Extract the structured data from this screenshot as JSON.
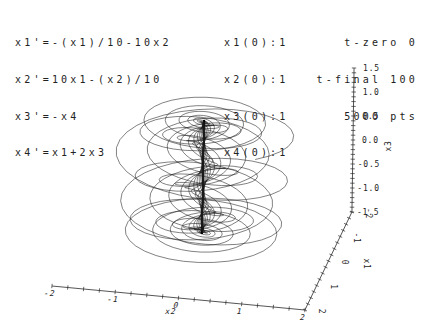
{
  "header": {
    "equations": [
      "x1'=-(x1)/10-10x2",
      "x2'=10x1-(x2)/10",
      "x3'=-x4",
      "x4'=x1+2x3"
    ],
    "initial_conditions": [
      "x1(0):1",
      "x2(0):1",
      "x3(0):1",
      "x4(0):1"
    ],
    "time_params": [
      "t-zero 0",
      "t-final 100",
      "5000 pts"
    ]
  },
  "colors": {
    "background": "#ffffff",
    "text": "#222222",
    "axis": "#2a2a2a",
    "trajectory": "#1a1a1a"
  },
  "chart_data": {
    "type": "line",
    "title": "",
    "ode": {
      "variables": [
        "x1",
        "x2",
        "x3",
        "x4"
      ],
      "equations": [
        "x1'=-(x1)/10-10x2",
        "x2'=10x1-(x2)/10",
        "x3'=-x4",
        "x4'=x1+2x3"
      ],
      "matrix": [
        [
          -0.1,
          -10.0,
          0.0,
          0.0
        ],
        [
          10.0,
          -0.1,
          0.0,
          0.0
        ],
        [
          0.0,
          0.0,
          0.0,
          -1.0
        ],
        [
          1.0,
          0.0,
          2.0,
          0.0
        ]
      ],
      "x0": [
        1,
        1,
        1,
        1
      ],
      "t_zero": 0,
      "t_final": 100,
      "n_points": 5000
    },
    "axes": {
      "x1": {
        "title": "x1",
        "min": -2,
        "max": 2,
        "tick_step": 0.25,
        "labels": [
          {
            "v": 2,
            "t": "2"
          },
          {
            "v": 1,
            "t": "1"
          },
          {
            "v": 0,
            "t": "0"
          },
          {
            "v": -1,
            "t": "-1"
          },
          {
            "v": -2,
            "t": "-2"
          }
        ]
      },
      "x2": {
        "title": "x2",
        "min": -2,
        "max": 2,
        "tick_step": 0.25,
        "labels": [
          {
            "v": -2,
            "t": "-2"
          },
          {
            "v": -1,
            "t": "-1"
          },
          {
            "v": 0,
            "t": "0"
          },
          {
            "v": 1,
            "t": "1"
          },
          {
            "v": 2,
            "t": "2"
          }
        ]
      },
      "x3": {
        "title": "x3",
        "min": -1.5,
        "max": 1.5,
        "tick_step": 0.1,
        "labels": [
          {
            "v": 1.5,
            "t": "1.5"
          },
          {
            "v": 1.0,
            "t": "1.0"
          },
          {
            "v": 0.5,
            "t": "0.5"
          },
          {
            "v": 0.0,
            "t": "0.0"
          },
          {
            "v": -0.5,
            "t": "-0.5"
          },
          {
            "v": -1.0,
            "t": "-1.0"
          },
          {
            "v": -1.5,
            "t": "-1.5"
          }
        ]
      }
    },
    "grid": false,
    "legend": false,
    "projection": {
      "origin": [
        203.0,
        177.0
      ],
      "e_x1": [
        -11.75,
        24.5
      ],
      "e_x2": [
        63.25,
        6.0
      ],
      "e_x3": [
        0.7,
        -48.0
      ]
    },
    "axis_style": {
      "color": "#2a2a2a",
      "line_width": 0.8,
      "tick_width": 0.7,
      "tick_half_len": 2.2
    },
    "stroke": {
      "color": "#1a1a1a",
      "width": 0.55
    },
    "layout": {
      "segments": [
        {
          "name": "x2-axis",
          "from": [
            2,
            -2,
            -1.5
          ],
          "to": [
            2,
            2,
            -1.5
          ],
          "vary": "x2"
        },
        {
          "name": "x1-axis",
          "from": [
            2,
            2,
            -1.5
          ],
          "to": [
            -2,
            2,
            -1.5
          ],
          "vary": "x1"
        },
        {
          "name": "x3-axis",
          "from": [
            -2,
            2,
            -1.5
          ],
          "to": [
            -2,
            2,
            1.5
          ],
          "vary": "x3"
        }
      ],
      "tick_label_style": {
        "x2": {
          "dx": -3,
          "dy": 10,
          "rotate": 0,
          "skew": -14,
          "anchor": "middle"
        },
        "x1": {
          "dx": 14,
          "dy": 1.5,
          "rotate": 90,
          "skew": 0,
          "anchor": "middle"
        },
        "x3": {
          "dx": 9,
          "dy": 2.5,
          "rotate": 0,
          "skew": 0,
          "anchor": "start",
          "neg_dx": 5
        }
      },
      "axis_titles": [
        {
          "text": "x2",
          "x": 170,
          "y": 314,
          "rotate": 0,
          "skew": -14
        },
        {
          "text": "x1",
          "x": 364,
          "y": 264,
          "rotate": 90,
          "skew": 0
        },
        {
          "text": "x3",
          "x": 391,
          "y": 146,
          "rotate": -90,
          "skew": 0
        }
      ]
    }
  }
}
